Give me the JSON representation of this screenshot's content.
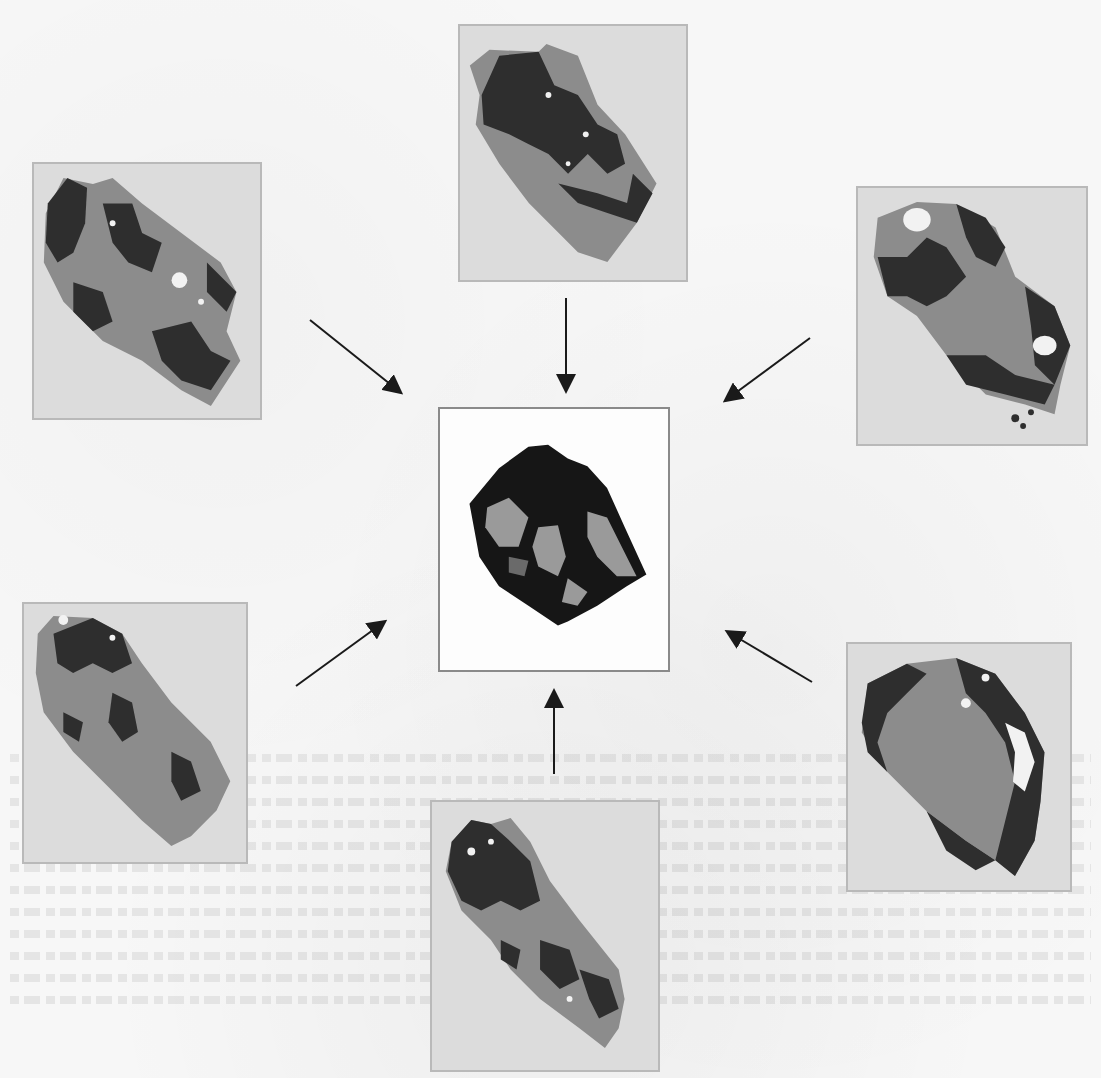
{
  "figure": {
    "colors": {
      "page_background": "#f7f7f7",
      "panel_background": "#dcdcdc",
      "panel_border": "#b9b9b9",
      "particle_mid_gray": "#8c8c8c",
      "particle_dark": "#2e2e2e",
      "center_background": "#fdfdfd",
      "center_border": "#8a8a8a",
      "center_particle": "#161616",
      "center_inclusion": "#9a9a9a",
      "arrow": "#1a1a1a"
    },
    "panels": [
      {
        "id": "top",
        "x": 458,
        "y": 24,
        "w": 230,
        "h": 258
      },
      {
        "id": "upper-left",
        "x": 32,
        "y": 162,
        "w": 230,
        "h": 258
      },
      {
        "id": "upper-right",
        "x": 856,
        "y": 186,
        "w": 232,
        "h": 260
      },
      {
        "id": "lower-left",
        "x": 22,
        "y": 602,
        "w": 226,
        "h": 262
      },
      {
        "id": "lower-right",
        "x": 846,
        "y": 642,
        "w": 226,
        "h": 250
      },
      {
        "id": "bottom",
        "x": 430,
        "y": 800,
        "w": 230,
        "h": 272
      }
    ],
    "center_panel": {
      "x": 438,
      "y": 407,
      "w": 232,
      "h": 265
    },
    "arrows": [
      {
        "from": "upper-left",
        "x1": 310,
        "y1": 320,
        "x2": 400,
        "y2": 392
      },
      {
        "from": "top",
        "x1": 566,
        "y1": 298,
        "x2": 566,
        "y2": 390
      },
      {
        "from": "upper-right",
        "x1": 810,
        "y1": 338,
        "x2": 726,
        "y2": 400
      },
      {
        "from": "lower-left",
        "x1": 296,
        "y1": 686,
        "x2": 384,
        "y2": 622
      },
      {
        "from": "bottom",
        "x1": 554,
        "y1": 774,
        "x2": 554,
        "y2": 692
      },
      {
        "from": "lower-right",
        "x1": 812,
        "y1": 682,
        "x2": 728,
        "y2": 632
      }
    ]
  }
}
